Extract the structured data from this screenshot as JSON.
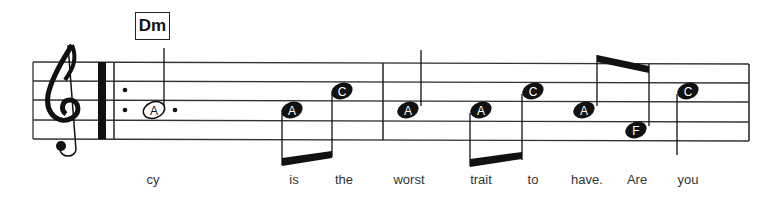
{
  "chord": {
    "label": "Dm"
  },
  "clef": "treble-clef",
  "notes": [
    {
      "letter": "A",
      "x": 154,
      "y": 110,
      "type": "half-dotted",
      "filled": false
    },
    {
      "letter": "A",
      "x": 292,
      "y": 110,
      "type": "eighth",
      "filled": true
    },
    {
      "letter": "C",
      "x": 342,
      "y": 91,
      "type": "eighth",
      "filled": true
    },
    {
      "letter": "A",
      "x": 408,
      "y": 110,
      "type": "quarter",
      "filled": true
    },
    {
      "letter": "A",
      "x": 481,
      "y": 110,
      "type": "eighth",
      "filled": true
    },
    {
      "letter": "C",
      "x": 533,
      "y": 91,
      "type": "eighth",
      "filled": true
    },
    {
      "letter": "A",
      "x": 584,
      "y": 110,
      "type": "eighth",
      "filled": true
    },
    {
      "letter": "F",
      "x": 636,
      "y": 130,
      "type": "eighth",
      "filled": true
    },
    {
      "letter": "C",
      "x": 688,
      "y": 91,
      "type": "quarter",
      "filled": true
    }
  ],
  "lyrics": [
    {
      "text": "cy",
      "x": 153
    },
    {
      "text": "is",
      "x": 294
    },
    {
      "text": "the",
      "x": 344
    },
    {
      "text": "worst",
      "x": 409
    },
    {
      "text": "trait",
      "x": 481
    },
    {
      "text": "to",
      "x": 533
    },
    {
      "text": "have.",
      "x": 587
    },
    {
      "text": "Are",
      "x": 637
    },
    {
      "text": "you",
      "x": 688
    }
  ]
}
